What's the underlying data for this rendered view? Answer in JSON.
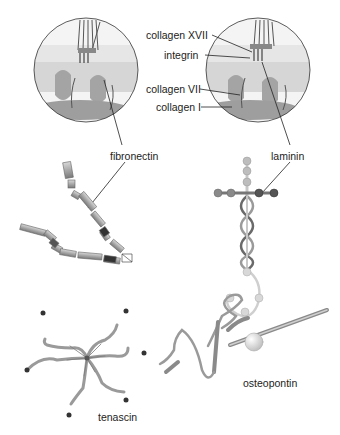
{
  "figure": {
    "labels": {
      "collagen_xvii": "collagen XVII",
      "integrin": "integrin",
      "collagen_vii": "collagen VII",
      "collagen_i": "collagen I",
      "fibronectin": "fibronectin",
      "laminin": "laminin",
      "tenascin": "tenascin",
      "osteopontin": "osteopontin"
    },
    "colors": {
      "protein_gray": "#9a9a9a",
      "protein_dark": "#3a3a3a",
      "protein_light": "#cfcfcf",
      "tissue": "#d9d9d9",
      "leader_line": "#222222"
    }
  }
}
